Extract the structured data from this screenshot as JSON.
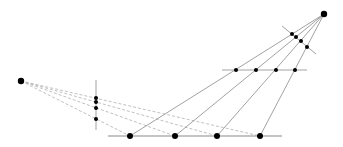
{
  "diagram": {
    "title": "",
    "colors": {
      "background": "#ffffff",
      "solid_line": "#8a8a8a",
      "dashed_line": "#b0b0b0",
      "point": "#000000"
    },
    "centers": [
      {
        "id": "top-right-center",
        "x": 324,
        "y": 14,
        "r": 3.2
      },
      {
        "id": "left-center",
        "x": 21,
        "y": 81,
        "r": 3.2
      }
    ],
    "lines": {
      "bottom_line": {
        "x1": 108,
        "y1": 136,
        "x2": 282,
        "y2": 136
      },
      "middle_line": {
        "x1": 222,
        "y1": 70,
        "x2": 307,
        "y2": 70
      },
      "tilted_line": {
        "x1": 282,
        "y1": 26,
        "x2": 316,
        "y2": 54
      },
      "vertical_line": {
        "x1": 96,
        "y1": 80,
        "x2": 96,
        "y2": 130
      }
    },
    "bottom_points": [
      {
        "x": 130,
        "y": 136,
        "r": 3
      },
      {
        "x": 175,
        "y": 136,
        "r": 3
      },
      {
        "x": 217,
        "y": 136,
        "r": 3
      },
      {
        "x": 260,
        "y": 136,
        "r": 3
      }
    ],
    "middle_points": [
      {
        "x": 236,
        "y": 70,
        "r": 2
      },
      {
        "x": 256,
        "y": 70,
        "r": 2
      },
      {
        "x": 276,
        "y": 70,
        "r": 2
      },
      {
        "x": 295,
        "y": 70,
        "r": 2
      }
    ],
    "tilted_points": [
      {
        "x": 292,
        "y": 34,
        "r": 2
      },
      {
        "x": 296,
        "y": 37,
        "r": 2
      },
      {
        "x": 301,
        "y": 41,
        "r": 2
      },
      {
        "x": 307,
        "y": 47,
        "r": 2
      }
    ],
    "vertical_points": [
      {
        "x": 96,
        "y": 98,
        "r": 2
      },
      {
        "x": 96,
        "y": 102,
        "r": 2
      },
      {
        "x": 96,
        "y": 108,
        "r": 2
      },
      {
        "x": 96,
        "y": 119,
        "r": 2
      }
    ]
  }
}
